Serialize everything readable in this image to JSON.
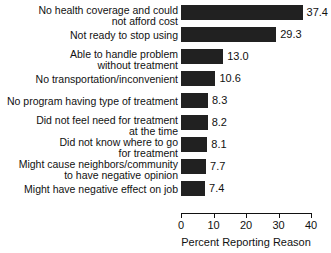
{
  "chart_data": {
    "type": "bar",
    "orientation": "horizontal",
    "title": "",
    "xlabel": "Percent Reporting Reason",
    "ylabel": "",
    "xlim": [
      0,
      40
    ],
    "xticks": [
      0,
      10,
      20,
      30,
      40
    ],
    "xtick_labels": [
      "0",
      "10",
      "20",
      "30",
      "40"
    ],
    "grid": false,
    "legend": null,
    "bar_color": "#212121",
    "categories": [
      "No health coverage and could\nnot afford cost",
      "Not ready to stop using",
      "Able to handle problem\nwithout treatment",
      "No transportation/inconvenient",
      "No program having type of treatment",
      "Did not feel need for treatment\nat the time",
      "Did not know where to go\nfor treatment",
      "Might cause neighbors/community\nto have negative opinion",
      "Might have negative effect on job"
    ],
    "values": [
      37.4,
      29.3,
      13.0,
      10.6,
      8.3,
      8.2,
      8.1,
      7.7,
      7.4
    ],
    "value_labels": [
      "37.4",
      "29.3",
      "13.0",
      "10.6",
      "8.3",
      "8.2",
      "8.1",
      "7.7",
      "7.4"
    ]
  }
}
